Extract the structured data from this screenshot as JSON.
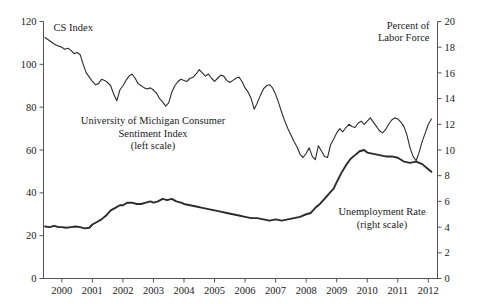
{
  "chart_data": {
    "type": "line",
    "title": "",
    "xlabel": "",
    "grid": false,
    "legend_position": "inline-annotations",
    "x_axis": {
      "tick_labels": [
        "2000",
        "2001",
        "2002",
        "2003",
        "2004",
        "2005",
        "2006",
        "2007",
        "2008",
        "2009",
        "2010",
        "2011",
        "2012"
      ],
      "range": [
        1999.4,
        2012.3
      ]
    },
    "left_axis": {
      "title_line1": "CS Index",
      "ticks": [
        0,
        20,
        40,
        60,
        80,
        100,
        120
      ],
      "range": [
        0,
        120
      ]
    },
    "right_axis": {
      "title_line1": "Percent of",
      "title_line2": "Labor Force",
      "ticks": [
        0,
        2,
        4,
        6,
        8,
        10,
        12,
        14,
        16,
        18,
        20
      ],
      "range": [
        0,
        20
      ]
    },
    "annotations": [
      {
        "name": "cs-index-annotation",
        "lines": [
          "University of Michigan Consumer",
          "Sentiment Index",
          "(left scale)"
        ],
        "x_px": 153,
        "y_px": 124
      },
      {
        "name": "unemployment-annotation",
        "lines": [
          "Unemployment Rate",
          "(right scale)"
        ],
        "x_px": 382,
        "y_px": 215
      }
    ],
    "series": [
      {
        "name": "University of Michigan Consumer Sentiment Index",
        "axis": "left",
        "color": "#2b2b2b",
        "x": [
          1999.45,
          1999.6,
          1999.75,
          1999.9,
          2000.0,
          2000.1,
          2000.2,
          2000.3,
          2000.4,
          2000.5,
          2000.6,
          2000.7,
          2000.8,
          2000.9,
          2001.0,
          2001.1,
          2001.2,
          2001.3,
          2001.4,
          2001.5,
          2001.6,
          2001.7,
          2001.8,
          2001.9,
          2002.0,
          2002.1,
          2002.2,
          2002.3,
          2002.4,
          2002.5,
          2002.6,
          2002.7,
          2002.8,
          2002.9,
          2003.0,
          2003.1,
          2003.2,
          2003.3,
          2003.4,
          2003.5,
          2003.6,
          2003.7,
          2003.8,
          2003.9,
          2004.0,
          2004.1,
          2004.2,
          2004.3,
          2004.4,
          2004.5,
          2004.6,
          2004.7,
          2004.8,
          2004.9,
          2005.0,
          2005.1,
          2005.2,
          2005.3,
          2005.4,
          2005.5,
          2005.6,
          2005.7,
          2005.8,
          2005.9,
          2006.0,
          2006.1,
          2006.2,
          2006.3,
          2006.4,
          2006.5,
          2006.6,
          2006.7,
          2006.8,
          2006.9,
          2007.0,
          2007.1,
          2007.2,
          2007.3,
          2007.4,
          2007.5,
          2007.6,
          2007.7,
          2007.8,
          2007.9,
          2008.0,
          2008.1,
          2008.2,
          2008.3,
          2008.4,
          2008.5,
          2008.6,
          2008.7,
          2008.8,
          2008.9,
          2009.0,
          2009.1,
          2009.2,
          2009.3,
          2009.4,
          2009.5,
          2009.6,
          2009.7,
          2009.8,
          2009.9,
          2010.0,
          2010.1,
          2010.2,
          2010.3,
          2010.4,
          2010.5,
          2010.6,
          2010.7,
          2010.8,
          2010.9,
          2011.0,
          2011.1,
          2011.2,
          2011.3,
          2011.4,
          2011.5,
          2011.6,
          2011.7,
          2011.8,
          2011.9,
          2012.0,
          2012.1
        ],
        "y": [
          112.5,
          111.0,
          109.5,
          108.5,
          108.0,
          107.0,
          107.5,
          106.5,
          105.0,
          105.5,
          104.5,
          100.0,
          96.0,
          94.0,
          92.0,
          90.5,
          91.0,
          93.0,
          92.5,
          91.5,
          90.0,
          86.0,
          83.0,
          88.0,
          90.0,
          92.5,
          94.5,
          95.5,
          93.5,
          91.0,
          90.0,
          89.0,
          88.5,
          89.0,
          88.0,
          86.5,
          84.0,
          82.5,
          80.5,
          82.0,
          87.0,
          90.0,
          92.0,
          93.0,
          92.5,
          92.0,
          93.5,
          94.0,
          95.5,
          97.5,
          96.0,
          94.5,
          95.5,
          93.5,
          92.0,
          93.5,
          95.0,
          94.5,
          92.5,
          91.5,
          92.5,
          93.5,
          94.0,
          92.0,
          89.0,
          87.0,
          84.0,
          79.0,
          82.0,
          85.5,
          88.5,
          90.0,
          90.5,
          89.0,
          86.0,
          82.0,
          77.5,
          73.5,
          70.0,
          67.0,
          64.0,
          61.5,
          58.0,
          56.5,
          58.5,
          61.0,
          57.0,
          55.5,
          62.0,
          59.5,
          57.0,
          56.5,
          62.5,
          65.0,
          68.0,
          70.0,
          68.5,
          70.5,
          72.0,
          71.0,
          70.5,
          72.5,
          73.5,
          72.0,
          73.5,
          75.0,
          73.0,
          71.0,
          69.0,
          68.0,
          69.5,
          72.0,
          74.0,
          75.0,
          74.5,
          73.0,
          71.0,
          67.0,
          61.0,
          57.0,
          55.0,
          59.0,
          64.0,
          68.0,
          72.0,
          74.5
        ]
      },
      {
        "name": "Unemployment Rate",
        "axis": "right",
        "color": "#2b2b2b",
        "x": [
          1999.45,
          1999.6,
          1999.75,
          1999.9,
          2000.0,
          2000.15,
          2000.3,
          2000.45,
          2000.6,
          2000.75,
          2000.9,
          2001.0,
          2001.15,
          2001.3,
          2001.45,
          2001.6,
          2001.75,
          2001.9,
          2002.0,
          2002.15,
          2002.3,
          2002.45,
          2002.6,
          2002.75,
          2002.9,
          2003.0,
          2003.15,
          2003.3,
          2003.45,
          2003.6,
          2003.75,
          2003.9,
          2004.0,
          2004.2,
          2004.4,
          2004.6,
          2004.8,
          2005.0,
          2005.2,
          2005.4,
          2005.6,
          2005.8,
          2006.0,
          2006.2,
          2006.4,
          2006.6,
          2006.8,
          2007.0,
          2007.2,
          2007.4,
          2007.6,
          2007.8,
          2008.0,
          2008.15,
          2008.3,
          2008.45,
          2008.6,
          2008.75,
          2008.9,
          2009.0,
          2009.15,
          2009.3,
          2009.45,
          2009.6,
          2009.75,
          2009.9,
          2010.0,
          2010.2,
          2010.4,
          2010.6,
          2010.8,
          2011.0,
          2011.2,
          2011.4,
          2011.6,
          2011.8,
          2012.0,
          2012.1
        ],
        "y": [
          4.05,
          4.0,
          4.1,
          4.0,
          4.0,
          3.95,
          4.0,
          4.05,
          4.0,
          3.9,
          3.95,
          4.2,
          4.4,
          4.6,
          4.9,
          5.3,
          5.5,
          5.7,
          5.7,
          5.9,
          5.9,
          5.8,
          5.8,
          5.9,
          6.0,
          5.9,
          6.0,
          6.2,
          6.1,
          6.2,
          6.0,
          5.9,
          5.8,
          5.7,
          5.6,
          5.5,
          5.4,
          5.3,
          5.2,
          5.1,
          5.0,
          4.9,
          4.8,
          4.7,
          4.7,
          4.6,
          4.5,
          4.6,
          4.5,
          4.6,
          4.7,
          4.8,
          5.0,
          5.1,
          5.5,
          5.8,
          6.2,
          6.6,
          7.0,
          7.5,
          8.2,
          8.8,
          9.3,
          9.6,
          9.9,
          10.0,
          9.8,
          9.7,
          9.6,
          9.5,
          9.5,
          9.4,
          9.1,
          9.0,
          9.1,
          8.9,
          8.5,
          8.3
        ]
      }
    ]
  }
}
